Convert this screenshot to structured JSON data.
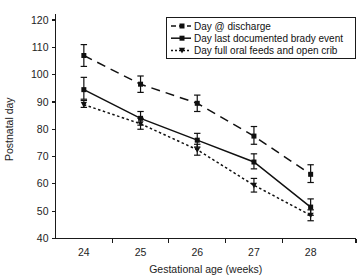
{
  "chart_data": {
    "type": "line",
    "title": "",
    "xlabel": "Gestational age (weeks)",
    "ylabel": "Postnatal day",
    "categories": [
      "24",
      "25",
      "26",
      "27",
      "28"
    ],
    "x": [
      24,
      25,
      26,
      27,
      28
    ],
    "xlim": [
      23.5,
      28.8
    ],
    "ylim": [
      40,
      120
    ],
    "ytick_labels": [
      "40",
      "50",
      "60",
      "70",
      "80",
      "90",
      "100",
      "110",
      "120"
    ],
    "yticks": [
      40,
      50,
      60,
      70,
      80,
      90,
      100,
      110,
      120
    ],
    "grid": false,
    "legend_position": "top-right",
    "series": [
      {
        "name": "Day @ discharge",
        "linestyle": "dashed",
        "marker": "square",
        "color": "#101010",
        "values": [
          107,
          96.5,
          89.5,
          77.5,
          63.5
        ],
        "err_low": [
          103,
          93.5,
          86.5,
          74.5,
          60.5
        ],
        "err_high": [
          111,
          99.5,
          92.5,
          81,
          67
        ]
      },
      {
        "name": "Day last documented brady event",
        "linestyle": "solid",
        "marker": "square",
        "color": "#101010",
        "values": [
          94.5,
          84,
          76,
          68,
          51.5
        ],
        "err_low": [
          91,
          81.5,
          73.5,
          65.5,
          48.5
        ],
        "err_high": [
          99,
          86.5,
          78.5,
          71,
          54.5
        ]
      },
      {
        "name": "Day full oral feeds and open crib",
        "linestyle": "dotted",
        "marker": "triangle-down",
        "color": "#101010",
        "values": [
          89,
          82,
          72.5,
          59.5,
          48.5
        ],
        "err_low": [
          88,
          80,
          70.5,
          57,
          46.5
        ],
        "err_high": [
          90.5,
          84,
          74.5,
          62,
          50.5
        ]
      }
    ]
  },
  "legend": {
    "entries": [
      {
        "label": "Day @ discharge"
      },
      {
        "label": "Day last documented brady event"
      },
      {
        "label": "Day full oral feeds and open crib"
      }
    ]
  }
}
